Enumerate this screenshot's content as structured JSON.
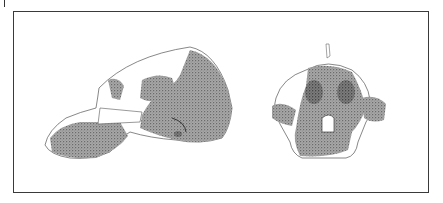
{
  "figure": {
    "views": [
      {
        "name": "lateral-view",
        "description": "Skull, lateral view (facing left)"
      },
      {
        "name": "frontal-view",
        "description": "Skull, frontal view"
      }
    ],
    "colors": {
      "frame": "#3a3a3a",
      "stipple": "#6b6b6b",
      "background": "#ffffff"
    }
  }
}
